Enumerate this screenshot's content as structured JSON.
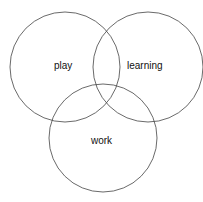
{
  "diagram": {
    "type": "venn",
    "sets": [
      {
        "label": "play",
        "cx": 65,
        "cy": 67,
        "r": 55
      },
      {
        "label": "learning",
        "cx": 148,
        "cy": 67,
        "r": 55
      },
      {
        "label": "work",
        "cx": 103,
        "cy": 138,
        "r": 54
      }
    ],
    "stroke_color": "#444444"
  }
}
